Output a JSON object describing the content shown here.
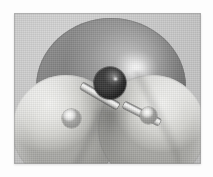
{
  "figure": {
    "kind": "molecular-model-render",
    "molecule_name": "water",
    "molecular_formula": "H2O",
    "model_style": "space-filling van der Waals surfaces with ball-and-stick core",
    "background_color": "#c9c9c9",
    "plate_border_color": "#969696",
    "page_background": "#fdfdfd",
    "caption": "",
    "title": "",
    "labels": []
  },
  "palette": {
    "oxygen_vdw_surface": "#9a9a9a",
    "oxygen_vdw_highlight": "#ffffff",
    "hydrogen_vdw_surface": "#e8e8e6",
    "hydrogen_vdw_shadow": "#ababa7",
    "oxygen_ball": "#4a4a4a",
    "hydrogen_ball": "#f2f2f0",
    "bond_cylinder": "#efefed",
    "bond_outline": "#6f6f6f",
    "background_light": "#d6d6d6",
    "background_dark": "#b6b6b6"
  },
  "atoms": [
    {
      "id": "O1",
      "element": "O",
      "element_name": "oxygen",
      "role": "central atom",
      "ball_color": "#4a4a4a",
      "vdw_surface_color": "#9a9a9a",
      "relative_size": "large"
    },
    {
      "id": "H1",
      "element": "H",
      "element_name": "hydrogen",
      "role": "terminal atom, front left",
      "ball_color": "#f2f2f0",
      "vdw_surface_color": "#e8e8e6",
      "relative_size": "small"
    },
    {
      "id": "H2",
      "element": "H",
      "element_name": "hydrogen",
      "role": "terminal atom, front right",
      "ball_color": "#f2f2f0",
      "vdw_surface_color": "#e8e8e6",
      "relative_size": "small"
    }
  ],
  "bonds": [
    {
      "id": "B1",
      "from": "O1",
      "to": "H1",
      "order": "single",
      "direction": "down-left"
    },
    {
      "id": "B2",
      "from": "O1",
      "to": "H2",
      "order": "single",
      "direction": "down-right"
    }
  ],
  "surfaces": [
    {
      "id": "S-O",
      "atom": "O1",
      "shape": "sphere",
      "layer": "back",
      "has_specular_highlight": true
    },
    {
      "id": "S-H1",
      "atom": "H1",
      "shape": "sphere-lobe",
      "layer": "front-left",
      "has_specular_highlight": true
    },
    {
      "id": "S-H2",
      "atom": "H2",
      "shape": "sphere-lobe",
      "layer": "front-right",
      "has_specular_highlight": true
    }
  ]
}
